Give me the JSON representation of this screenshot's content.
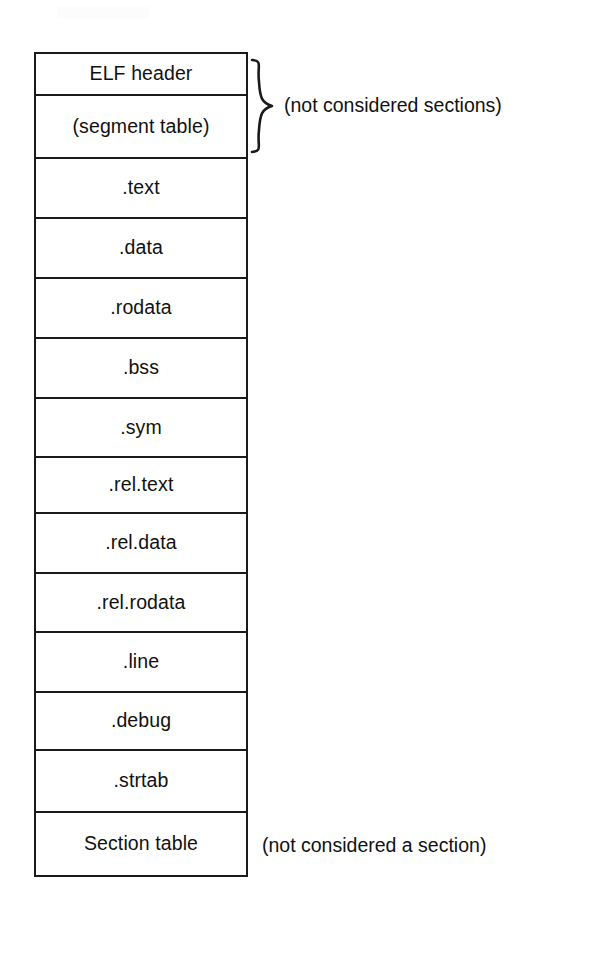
{
  "figure": {
    "artifact_text": ""
  },
  "elf_stack": {
    "rows": [
      {
        "label": "ELF header",
        "height": 42
      },
      {
        "label": "(segment table)",
        "height": 63
      },
      {
        "label": ".text",
        "height": 60
      },
      {
        "label": ".data",
        "height": 60
      },
      {
        "label": ".rodata",
        "height": 60
      },
      {
        "label": ".bss",
        "height": 60
      },
      {
        "label": ".sym",
        "height": 59
      },
      {
        "label": ".rel.text",
        "height": 56
      },
      {
        "label": ".rel.data",
        "height": 60
      },
      {
        "label": ".rel.rodata",
        "height": 59
      },
      {
        "label": ".line",
        "height": 60
      },
      {
        "label": ".debug",
        "height": 58
      },
      {
        "label": ".strtab",
        "height": 62
      },
      {
        "label": "Section table",
        "height": 62
      }
    ]
  },
  "annotations": {
    "brace_note": "(not considered sections)",
    "bottom_note": "(not considered a section)"
  },
  "colors": {
    "stroke": "#1a1a1a",
    "text": "#111111",
    "background": "#ffffff"
  }
}
